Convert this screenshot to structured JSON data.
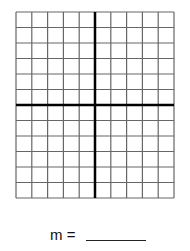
{
  "worksheet": {
    "grid": {
      "columns": 10,
      "rows": 12,
      "cell_width": 15.8,
      "cell_height": 15.5,
      "y_axis_col": 5,
      "x_axis_row": 6,
      "line_color": "#666666",
      "axis_color": "#000000"
    },
    "slope_label": "m =",
    "answer_value": ""
  }
}
